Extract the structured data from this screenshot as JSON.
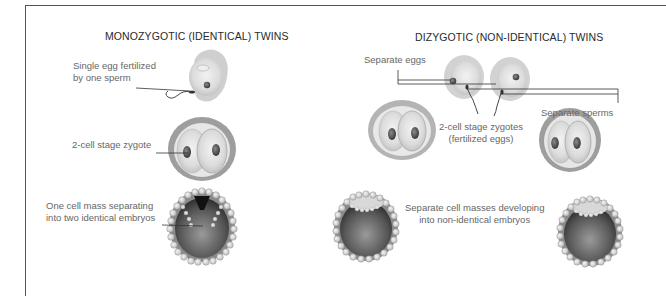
{
  "monozygotic": {
    "title": "MONOZYGOTIC (IDENTICAL) TWINS",
    "labels": {
      "single_egg_line1": "Single egg fertilized",
      "single_egg_line2": "by one sperm",
      "two_cell": "2-cell stage zygote",
      "cell_mass_line1": "One cell mass separating",
      "cell_mass_line2": "into two identical embryos"
    }
  },
  "dizygotic": {
    "title": "DIZYGOTIC (NON-IDENTICAL) TWINS",
    "labels": {
      "separate_eggs": "Separate eggs",
      "separate_sperms": "Separate sperms",
      "two_cell_line1": "2-cell stage zygotes",
      "two_cell_line2": "(fertilized eggs)",
      "cell_masses_line1": "Separate cell masses developing",
      "cell_masses_line2": "into non-identical embryos"
    }
  }
}
